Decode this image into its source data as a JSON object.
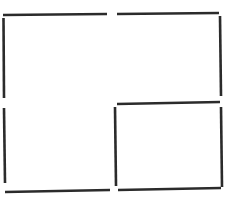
{
  "diagram": {
    "width": 226,
    "height": 197,
    "background": "#ffffff",
    "stroke_color": "#2b2b2b",
    "stroke_width": 2.6,
    "segments": [
      {
        "name": "top-left-horizontal-segment",
        "x1": 3,
        "y1": 15,
        "x2": 107,
        "y2": 14
      },
      {
        "name": "top-right-horizontal-segment",
        "x1": 117,
        "y1": 14,
        "x2": 219,
        "y2": 13
      },
      {
        "name": "left-upper-vertical-segment",
        "x1": 3.5,
        "y1": 18,
        "x2": 4,
        "y2": 98
      },
      {
        "name": "right-upper-vertical-segment",
        "x1": 220,
        "y1": 16,
        "x2": 221,
        "y2": 96
      },
      {
        "name": "left-lower-vertical-segment",
        "x1": 4,
        "y1": 108,
        "x2": 5,
        "y2": 183
      },
      {
        "name": "middle-horizontal-segment",
        "x1": 117,
        "y1": 104,
        "x2": 220,
        "y2": 102
      },
      {
        "name": "inner-left-vertical-segment",
        "x1": 115,
        "y1": 107,
        "x2": 116,
        "y2": 186
      },
      {
        "name": "right-lower-vertical-segment",
        "x1": 221,
        "y1": 107,
        "x2": 222,
        "y2": 187
      },
      {
        "name": "bottom-left-horizontal-segment",
        "x1": 5,
        "y1": 192,
        "x2": 110,
        "y2": 190
      },
      {
        "name": "bottom-right-horizontal-segment",
        "x1": 118,
        "y1": 190,
        "x2": 221,
        "y2": 188
      }
    ]
  }
}
